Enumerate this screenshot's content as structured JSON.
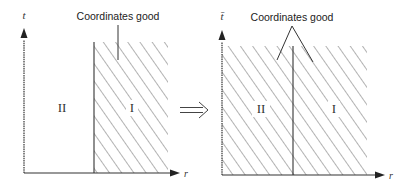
{
  "figure": {
    "left_panel": {
      "y_axis_label": "t",
      "x_axis_label": "r",
      "region_II_label": "II",
      "region_I_label": "I",
      "annotation": "Coordinates good",
      "hatched_regions": [
        "I"
      ]
    },
    "transition_arrow": "⟹",
    "right_panel": {
      "y_axis_label": "t̄",
      "x_axis_label": "r",
      "region_II_label": "II",
      "region_I_label": "I",
      "annotation": "Coordinates good",
      "hatched_regions": [
        "I",
        "II"
      ]
    },
    "colors": {
      "line": "#333333",
      "hatch": "#555555",
      "background": "#ffffff"
    }
  }
}
